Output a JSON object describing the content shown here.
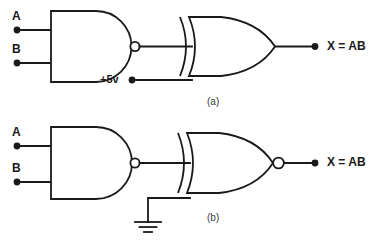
{
  "figure": {
    "background_color": "#ffffff",
    "line_color": "#1a1a1a"
  },
  "circuits": [
    {
      "id": "circuit-a",
      "caption": "(a)",
      "description": "NAND output and +5v into an XOR gate",
      "inputs": [
        {
          "label": "A",
          "name": "input-a"
        },
        {
          "label": "B",
          "name": "input-b"
        }
      ],
      "gates": [
        {
          "type": "nand",
          "name": "nand-gate",
          "has_output_bubble": true
        },
        {
          "type": "xor",
          "name": "xor-gate",
          "has_output_bubble": false
        }
      ],
      "supply": {
        "label": "+5v",
        "name": "supply-terminal"
      },
      "output": {
        "label": "X = AB",
        "name": "output-x"
      }
    },
    {
      "id": "circuit-b",
      "caption": "(b)",
      "description": "NAND output and ground into an XNOR gate",
      "inputs": [
        {
          "label": "A",
          "name": "input-a"
        },
        {
          "label": "B",
          "name": "input-b"
        }
      ],
      "gates": [
        {
          "type": "nand",
          "name": "nand-gate",
          "has_output_bubble": true
        },
        {
          "type": "xnor",
          "name": "xnor-gate",
          "has_output_bubble": true
        }
      ],
      "ground": {
        "label": "",
        "name": "ground-symbol"
      },
      "output": {
        "label": "X = AB",
        "name": "output-x"
      }
    }
  ]
}
